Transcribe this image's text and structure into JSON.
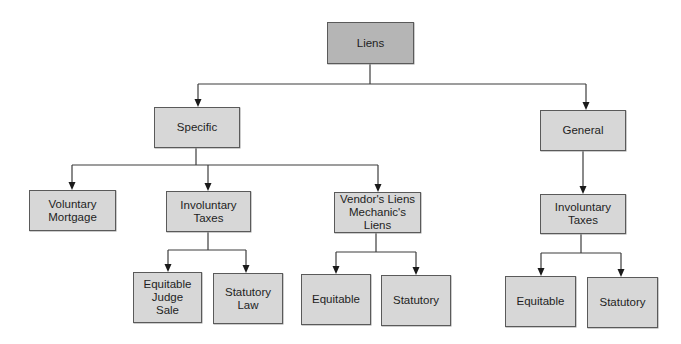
{
  "diagram": {
    "type": "tree",
    "title": "Liens",
    "colors": {
      "root_fill": "#b5b5b5",
      "node_fill": "#d7d7d7",
      "border": "#5a5a5a",
      "line": "#3c3c3c"
    },
    "nodes": {
      "liens": {
        "label": "Liens",
        "x": 327,
        "y": 22,
        "w": 87,
        "h": 42
      },
      "specific": {
        "label": "Specific",
        "x": 154,
        "y": 107,
        "w": 86,
        "h": 41
      },
      "general": {
        "label": "General",
        "x": 540,
        "y": 110,
        "w": 86,
        "h": 41
      },
      "voluntary": {
        "label": "Voluntary\nMortgage",
        "x": 29,
        "y": 190,
        "w": 87,
        "h": 41
      },
      "involuntary_left": {
        "label": "Involuntary\nTaxes",
        "x": 166,
        "y": 191,
        "w": 85,
        "h": 41
      },
      "vendors": {
        "label": "Vendor's Liens\nMechanic's Liens",
        "x": 334,
        "y": 192,
        "w": 87,
        "h": 41
      },
      "involuntary_right": {
        "label": "Involuntary\nTaxes",
        "x": 540,
        "y": 194,
        "w": 86,
        "h": 40
      },
      "equitable_judge": {
        "label": "Equitable\nJudge\nSale",
        "x": 133,
        "y": 272,
        "w": 69,
        "h": 51
      },
      "statutory_law": {
        "label": "Statutory\nLaw",
        "x": 213,
        "y": 273,
        "w": 70,
        "h": 51
      },
      "equitable_mid": {
        "label": "Equitable",
        "x": 301,
        "y": 274,
        "w": 70,
        "h": 51
      },
      "statutory_mid": {
        "label": "Statutory",
        "x": 381,
        "y": 275,
        "w": 70,
        "h": 51
      },
      "equitable_right": {
        "label": "Equitable",
        "x": 505,
        "y": 276,
        "w": 71,
        "h": 51
      },
      "statutory_right": {
        "label": "Statutory",
        "x": 587,
        "y": 277,
        "w": 71,
        "h": 51
      }
    },
    "edges": [
      {
        "from": "liens",
        "to": "specific"
      },
      {
        "from": "liens",
        "to": "general"
      },
      {
        "from": "specific",
        "to": "voluntary"
      },
      {
        "from": "specific",
        "to": "involuntary_left"
      },
      {
        "from": "specific",
        "to": "vendors"
      },
      {
        "from": "involuntary_left",
        "to": "equitable_judge"
      },
      {
        "from": "involuntary_left",
        "to": "statutory_law"
      },
      {
        "from": "vendors",
        "to": "equitable_mid"
      },
      {
        "from": "vendors",
        "to": "statutory_mid"
      },
      {
        "from": "general",
        "to": "involuntary_right"
      },
      {
        "from": "involuntary_right",
        "to": "equitable_right"
      },
      {
        "from": "involuntary_right",
        "to": "statutory_right"
      }
    ]
  }
}
